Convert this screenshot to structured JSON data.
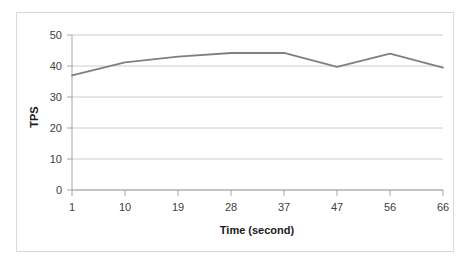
{
  "chart_data": {
    "type": "line",
    "title": "",
    "xlabel": "Time (second)",
    "ylabel": "TPS",
    "x": [
      1,
      10,
      19,
      28,
      37,
      47,
      56,
      66
    ],
    "xtick_labels": [
      "1",
      "10",
      "19",
      "28",
      "37",
      "47",
      "56",
      "66"
    ],
    "values": [
      37.0,
      41.2,
      43.0,
      44.2,
      44.2,
      39.7,
      44.0,
      39.5
    ],
    "series": [
      {
        "name": "TPS",
        "values": [
          37.0,
          41.2,
          43.0,
          44.2,
          44.2,
          39.7,
          44.0,
          39.5
        ]
      }
    ],
    "ylim": [
      0,
      50
    ],
    "ytick_labels": [
      "0",
      "10",
      "20",
      "30",
      "40",
      "50"
    ],
    "ytick_values": [
      0,
      10,
      20,
      30,
      40,
      50
    ],
    "grid": "horizontal",
    "legend": "none",
    "line_color": "#7f7f7f",
    "grid_color": "#bfbfbf",
    "axis_color": "#9a9a9a",
    "text_color": "#404040",
    "border_color": "#d9d9d9",
    "background": "#ffffff"
  }
}
